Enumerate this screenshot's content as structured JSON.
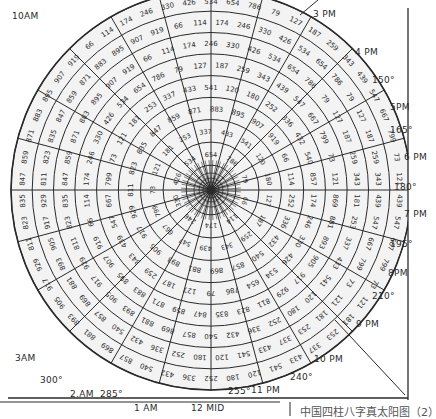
{
  "diagram": {
    "type": "polar-grid-table",
    "center": {
      "x": 211,
      "y": 190
    },
    "outer_radius": 200,
    "ring_count": 9,
    "spoke_count": 24,
    "colors": {
      "ink": "#2a2a2a",
      "paper": "#ffffff",
      "caption": "#555555"
    },
    "time_labels": [
      {
        "text": "10AM",
        "x": 12,
        "y": 16
      },
      {
        "text": "3 PM",
        "x": 313,
        "y": 14
      },
      {
        "text": "4 PM",
        "x": 355,
        "y": 52
      },
      {
        "text": "5PM",
        "x": 390,
        "y": 107
      },
      {
        "text": "6 PM",
        "x": 404,
        "y": 157
      },
      {
        "text": "7 PM",
        "x": 404,
        "y": 214
      },
      {
        "text": "8PM",
        "x": 388,
        "y": 273
      },
      {
        "text": "9 PM",
        "x": 356,
        "y": 324
      },
      {
        "text": "10 PM",
        "x": 314,
        "y": 359
      },
      {
        "text": "11 PM",
        "x": 251,
        "y": 390
      },
      {
        "text": "3AM",
        "x": 15,
        "y": 358
      },
      {
        "text": "2.AM",
        "x": 70,
        "y": 394
      },
      {
        "text": "1 AM",
        "x": 134,
        "y": 408
      },
      {
        "text": "12 MID",
        "x": 191,
        "y": 408
      }
    ],
    "degree_labels": [
      {
        "text": "150°",
        "x": 372,
        "y": 80
      },
      {
        "text": "165°",
        "x": 390,
        "y": 130
      },
      {
        "text": "180°",
        "x": 394,
        "y": 187
      },
      {
        "text": "195°",
        "x": 390,
        "y": 244
      },
      {
        "text": "210°",
        "x": 372,
        "y": 296
      },
      {
        "text": "240°",
        "x": 290,
        "y": 377
      },
      {
        "text": "255°",
        "x": 228,
        "y": 391
      },
      {
        "text": "285°",
        "x": 100,
        "y": 394
      },
      {
        "text": "300°",
        "x": 40,
        "y": 380
      }
    ],
    "sample_cell_values": {
      "ring_1_right": [
        "66",
        "114",
        "174",
        "246",
        "330",
        "426",
        "534",
        "654",
        "786"
      ],
      "ring_row_below_center_right": [
        "79",
        "127",
        "187",
        "259",
        "343",
        "439",
        "547",
        "667",
        "799"
      ],
      "ring_row_left": [
        "73",
        "121",
        "181",
        "253",
        "337",
        "433",
        "541"
      ],
      "ring_row_left_2": [
        "120",
        "180",
        "252",
        "336",
        "432",
        "540"
      ],
      "outer_right_column": [
        "857",
        "869",
        "881",
        "893",
        "905",
        "917",
        "929"
      ],
      "outer_right_lower": [
        "811",
        "823",
        "835",
        "847",
        "859",
        "871",
        "883",
        "895",
        "907",
        "919"
      ]
    }
  },
  "caption": {
    "text": "中国四柱八字真太阳图（2）"
  }
}
